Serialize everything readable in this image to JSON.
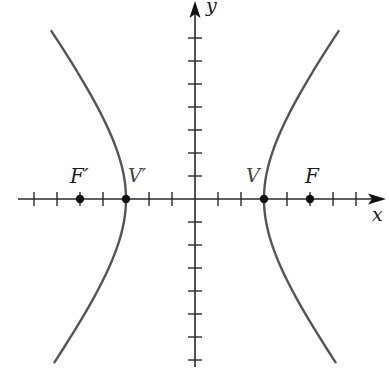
{
  "diagram": {
    "type": "hyperbola",
    "axes": {
      "x_label": "x",
      "y_label": "y",
      "unit_px": 23,
      "origin_px": [
        195,
        199
      ],
      "x_ticks": [
        -7,
        -6,
        -5,
        -4,
        -3,
        -2,
        -1,
        1,
        2,
        3,
        4,
        5,
        6,
        7
      ],
      "y_ticks": [
        -7,
        -6,
        -5,
        -4,
        -3,
        -2,
        -1,
        1,
        2,
        3,
        4,
        5,
        6,
        7
      ]
    },
    "curve": {
      "a": 3,
      "b": 4,
      "y_range": [
        -7.1,
        7.3
      ],
      "color": "#555555"
    },
    "points": [
      {
        "label": "F′",
        "x": -5,
        "kind": "focus"
      },
      {
        "label": "V′",
        "x": -3,
        "kind": "vertex"
      },
      {
        "label": "V",
        "x": 3,
        "kind": "vertex"
      },
      {
        "label": "F",
        "x": 5,
        "kind": "focus"
      }
    ],
    "colors": {
      "axis": "#2a2a2a",
      "curve": "#555555",
      "point": "#111111"
    }
  },
  "labels": {
    "x_axis": "x",
    "y_axis": "y",
    "focus_left": "F′",
    "vertex_left": "V′",
    "vertex_right": "V",
    "focus_right": "F"
  }
}
